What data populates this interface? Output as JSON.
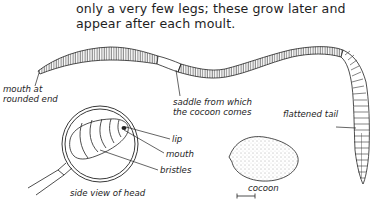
{
  "text": {
    "lines": [
      "only a very few legs; these grow later and",
      "appear after each moult."
    ]
  },
  "figure": {
    "labels": {
      "mouth_line1": "mouth at",
      "mouth_line2": "rounded end",
      "saddle_line1": "saddle from which",
      "saddle_line2": "the cocoon comes",
      "tail": "flattened tail",
      "lip": "lip",
      "mouth": "mouth",
      "bristles": "bristles",
      "head_caption": "side view of head",
      "cocoon": "cocoon"
    },
    "icons": [
      "earthworm-drawing",
      "magnifying-glass-icon",
      "cocoon-drawing",
      "scale-bar"
    ]
  }
}
